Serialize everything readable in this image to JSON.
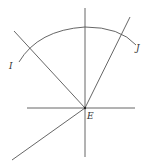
{
  "diagram": {
    "labels": {
      "left_arc_end": "I",
      "right_arc_end": "J",
      "center": "E"
    },
    "line_color": "#555555",
    "background": "#ffffff"
  }
}
